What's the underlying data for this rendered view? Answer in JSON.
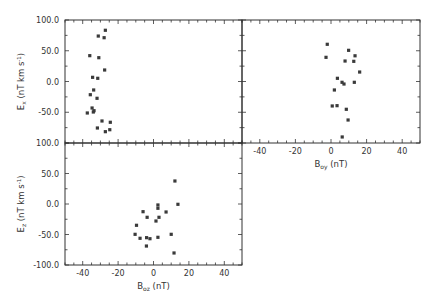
{
  "header_text": "",
  "chart_data": [
    {
      "type": "scatter",
      "panel": "top-left",
      "title": "",
      "xlabel": "",
      "ylabel": "Ex (nT km s-1)",
      "ylabel_main": "E",
      "ylabel_sub": "x",
      "ylabel_rest": " (nT  km  s",
      "ylabel_sup": "-1",
      "xlim": [
        -50,
        50
      ],
      "ylim": [
        -100,
        100
      ],
      "yticks": [
        "100.0",
        "50.0",
        "0.0",
        "-50.0"
      ],
      "grid": false,
      "points": [
        {
          "x": -27.2,
          "y": 83.3
        },
        {
          "x": -31.2,
          "y": 73.9
        },
        {
          "x": -27.9,
          "y": 71.2
        },
        {
          "x": -36.0,
          "y": 42.0
        },
        {
          "x": -30.9,
          "y": 38.7
        },
        {
          "x": -27.6,
          "y": 18.7
        },
        {
          "x": -34.4,
          "y": 6.8
        },
        {
          "x": -31.5,
          "y": 5.2
        },
        {
          "x": -33.8,
          "y": -13.8
        },
        {
          "x": -35.7,
          "y": -21.5
        },
        {
          "x": -31.9,
          "y": -27.3
        },
        {
          "x": -34.7,
          "y": -43.1
        },
        {
          "x": -33.6,
          "y": -47.5
        },
        {
          "x": -34.0,
          "y": -49.6
        },
        {
          "x": -37.4,
          "y": -51.2
        },
        {
          "x": -29.1,
          "y": -64.2
        },
        {
          "x": -24.4,
          "y": -66.3
        },
        {
          "x": -31.7,
          "y": -75.6
        },
        {
          "x": -24.7,
          "y": -78.4
        },
        {
          "x": -27.2,
          "y": -81.6
        }
      ]
    },
    {
      "type": "scatter",
      "panel": "top-right",
      "title": "",
      "xlabel": "Boy (nT)",
      "xlabel_main": "B",
      "xlabel_sub": "oy",
      "xlabel_rest": " (nT)",
      "ylabel": "Ex (nT km s-1)",
      "xlim": [
        -50,
        50
      ],
      "ylim": [
        -100,
        100
      ],
      "xticks": [
        "-40",
        "-20",
        "0",
        "20",
        "40"
      ],
      "grid": false,
      "points": [
        {
          "x": -2.1,
          "y": 60.5
        },
        {
          "x": 9.9,
          "y": 50.7
        },
        {
          "x": -2.8,
          "y": 39.3
        },
        {
          "x": 13.5,
          "y": 41.8
        },
        {
          "x": 7.9,
          "y": 33.3
        },
        {
          "x": 12.8,
          "y": 32.8
        },
        {
          "x": 16.1,
          "y": 15.4
        },
        {
          "x": 3.6,
          "y": 5.2
        },
        {
          "x": 6.2,
          "y": -1.3
        },
        {
          "x": 7.3,
          "y": -4.1
        },
        {
          "x": 13.1,
          "y": -1.3
        },
        {
          "x": 1.9,
          "y": -13.8
        },
        {
          "x": 0.7,
          "y": -39.8
        },
        {
          "x": 3.4,
          "y": -39.3
        },
        {
          "x": 8.6,
          "y": -45.2
        },
        {
          "x": 9.6,
          "y": -62.6
        },
        {
          "x": 6.3,
          "y": -90.2
        }
      ]
    },
    {
      "type": "scatter",
      "panel": "bottom-left",
      "title": "",
      "xlabel": "Boz (nT)",
      "xlabel_main": "B",
      "xlabel_sub": "oz",
      "xlabel_rest": " (nT)",
      "ylabel": "Ez (nT km s-1)",
      "ylabel_main": "E",
      "ylabel_sub": "z",
      "ylabel_rest": " (nT  km  s",
      "ylabel_sup": "-1",
      "xlim": [
        -50,
        50
      ],
      "ylim": [
        -100,
        100
      ],
      "xticks": [
        "-40",
        "-20",
        "0",
        "20",
        "40"
      ],
      "yticks": [
        "100.0",
        "50.0",
        "0.0",
        "-50.0",
        "-100.0"
      ],
      "grid": false,
      "points": [
        {
          "x": 12.1,
          "y": 37.7
        },
        {
          "x": 2.5,
          "y": -1.6
        },
        {
          "x": 2.5,
          "y": -7.0
        },
        {
          "x": 13.8,
          "y": -0.5
        },
        {
          "x": -5.9,
          "y": -12.6
        },
        {
          "x": 7.1,
          "y": -13.1
        },
        {
          "x": -3.6,
          "y": -21.8
        },
        {
          "x": 3.1,
          "y": -21.8
        },
        {
          "x": 1.4,
          "y": -27.9
        },
        {
          "x": -9.6,
          "y": -34.9
        },
        {
          "x": -10.4,
          "y": -49.7
        },
        {
          "x": 10.0,
          "y": -49.7
        },
        {
          "x": -7.6,
          "y": -56.2
        },
        {
          "x": -3.9,
          "y": -55.2
        },
        {
          "x": -2.0,
          "y": -56.9
        },
        {
          "x": 2.5,
          "y": -54.6
        },
        {
          "x": -4.0,
          "y": -68.9
        },
        {
          "x": 11.6,
          "y": -80.3
        }
      ]
    }
  ]
}
